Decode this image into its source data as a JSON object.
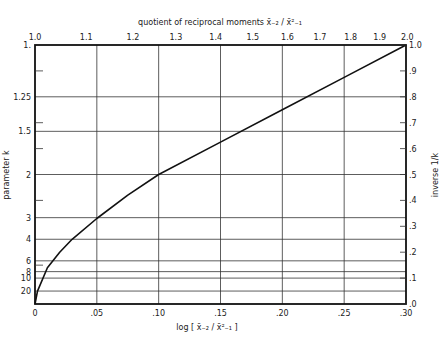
{
  "chart_data": {
    "type": "line",
    "title": "",
    "top_axis": {
      "label": "quotient of reciprocal moments  x̄₋₂/x̄²₋₁",
      "ticks": [
        "1.0",
        "1.1",
        "1.2",
        "1.3",
        "1.4",
        "1.5",
        "1.6",
        "1.7",
        "1.8",
        "1.9",
        "2.0"
      ],
      "scale": "log"
    },
    "xlabel": "log [x̄₋₂/x̄²₋₁]",
    "x_ticks": [
      "0",
      ".05",
      ".10",
      ".15",
      ".20",
      ".25",
      ".30"
    ],
    "xlim": [
      0,
      0.3
    ],
    "ylabel_left": "parameter k",
    "left_ticks": [
      "1.",
      "1.25",
      "1.5",
      "2",
      "3",
      "4",
      "6",
      "8",
      "10",
      "20"
    ],
    "ylabel_right": "inverse 1/k",
    "right_ticks": [
      "1.0",
      ".9",
      ".8",
      ".7",
      ".6",
      ".5",
      ".4",
      ".3",
      ".2",
      ".1",
      ".0"
    ],
    "ylim": [
      0,
      1.0
    ],
    "grid": true,
    "series": [
      {
        "name": "1/k vs log quotient",
        "x": [
          0,
          0.002,
          0.01,
          0.02,
          0.03,
          0.05,
          0.075,
          0.1,
          0.15,
          0.2,
          0.25,
          0.3
        ],
        "y": [
          0,
          0.05,
          0.14,
          0.2,
          0.25,
          0.33,
          0.42,
          0.5,
          0.625,
          0.75,
          0.875,
          1.0
        ]
      }
    ]
  },
  "labels": {
    "top_axis_title": "quotient of reciprocal moments",
    "top_axis_formula": "x̄₋₂ / x̄²₋₁",
    "bottom_axis_title": "log [ x̄₋₂ / x̄²₋₁ ]",
    "left_axis_title": "parameter k",
    "right_axis_title": "inverse 1/k"
  }
}
